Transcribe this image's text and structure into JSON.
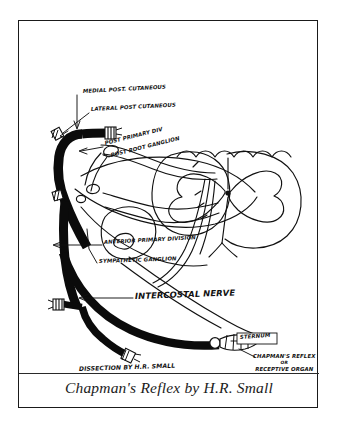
{
  "plate": {
    "caption": "Chapman's Reflex by H.R. Small",
    "credit": "DISSECTION BY H.R. SMALL"
  },
  "figure": {
    "type": "hand-drawn-anatomical-diagram",
    "ink_color": "#111111",
    "paper_color": "#ffffff",
    "frame_color": "#1a1a1a"
  },
  "annotations": [
    {
      "id": "medial-post-cutaneous",
      "text": "MEDIAL POST. CUTANEOUS",
      "x": 64,
      "y": 70,
      "rotate": -3,
      "size": "sz7",
      "leader": "vertical arrow down to upper nerve stump"
    },
    {
      "id": "lateral-post-cutaneous",
      "text": "LATERAL POST CUTANEOUS",
      "x": 72,
      "y": 88,
      "rotate": -3,
      "size": "sz7",
      "leader": "diagonal arrow down-left to nerve branch"
    },
    {
      "id": "post-primary-div",
      "text": "POST PRIMARY DIV",
      "x": 86,
      "y": 123,
      "rotate": -14,
      "size": "sz7",
      "leader": "horizontal arrow left to black trunk"
    },
    {
      "id": "post-root-ganglion",
      "text": "POST ROOT GANGLION",
      "x": 92,
      "y": 135,
      "rotate": -14,
      "size": "sz7",
      "leader": "short tick to ganglion swelling"
    },
    {
      "id": "anterior-primary-division",
      "text": "ANTERIOR PRIMARY DIVISION",
      "x": 85,
      "y": 222,
      "rotate": -3,
      "size": "sz7",
      "leader": "long horizontal leader line to left"
    },
    {
      "id": "sympathetic-ganglion",
      "text": "SYMPATHETIC GANGLION",
      "x": 80,
      "y": 241,
      "rotate": -2,
      "size": "sz7",
      "leader": "diagonal leader up-left to ganglion"
    },
    {
      "id": "intercostal-nerve",
      "text": "INTERCOSTAL NERVE",
      "x": 116,
      "y": 275,
      "rotate": -2,
      "size": "sz10",
      "leader": "horizontal arrow left to thick black nerve"
    },
    {
      "id": "sternum",
      "text": "STERNUM",
      "x": 220,
      "y": 318,
      "rotate": -4,
      "size": "sz8",
      "leader": "boxed label at nerve termination"
    },
    {
      "id": "chapmans-reflex-receptive-organ",
      "text": "CHAPMAN'S REFLEX",
      "text2": "OR",
      "text3": "RECEPTIVE ORGAN",
      "x": 234,
      "y": 336,
      "rotate": 0,
      "size": "sz7",
      "leader": "diagonal leader up-left to terminal body"
    },
    {
      "id": "dissection-credit",
      "text": "DISSECTION BY H.R. SMALL",
      "x": 60,
      "y": 348,
      "rotate": -2,
      "size": "sz8",
      "leader": "none"
    }
  ],
  "structures": [
    {
      "id": "posterior-nerve-trunk",
      "kind": "thick-black-nerve-trunk"
    },
    {
      "id": "cut-nerve-stump-upper",
      "kind": "cut-nerve-end"
    },
    {
      "id": "cut-nerve-stump-left",
      "kind": "cut-nerve-end"
    },
    {
      "id": "cut-nerve-stump-lower",
      "kind": "cut-nerve-end"
    },
    {
      "id": "intercostal-nerve-trunk",
      "kind": "thick-black-nerve-trunk"
    },
    {
      "id": "spinal-cord-cross-section",
      "kind": "outline-spinal-cord"
    },
    {
      "id": "gray-matter-butterfly",
      "kind": "outline-gray-matter"
    },
    {
      "id": "vertebral-body",
      "kind": "outline-bone"
    },
    {
      "id": "rib-outline",
      "kind": "outline-bone"
    },
    {
      "id": "posterior-root-ganglion",
      "kind": "ganglion-oval"
    },
    {
      "id": "sympathetic-ganglion-body",
      "kind": "ganglion-oval"
    },
    {
      "id": "receptive-organ-terminal",
      "kind": "terminal-body"
    }
  ]
}
